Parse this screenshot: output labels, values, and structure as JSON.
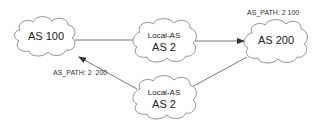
{
  "diagram": {
    "nodes": [
      {
        "id": "as100",
        "label": "AS 100"
      },
      {
        "id": "local_top",
        "sublabel": "Local-AS",
        "label": "AS 2"
      },
      {
        "id": "as200",
        "label": "AS 200"
      },
      {
        "id": "local_bottom",
        "sublabel": "Local-AS",
        "label": "AS 2"
      }
    ],
    "edges": [
      {
        "from": "as100",
        "to": "local_top",
        "arrow": false
      },
      {
        "from": "local_top",
        "to": "as200",
        "arrow": true
      },
      {
        "from": "local_bottom",
        "to": "as100",
        "arrow": true
      },
      {
        "from": "local_bottom",
        "to": "as200",
        "arrow": false
      }
    ],
    "annotations": {
      "as200_path": "AS_PATH: 2 100",
      "as100_path": "AS_PATH: 2  200"
    },
    "colors": {
      "stroke": "#555555",
      "background": "#ffffff",
      "text": "#222222"
    }
  }
}
